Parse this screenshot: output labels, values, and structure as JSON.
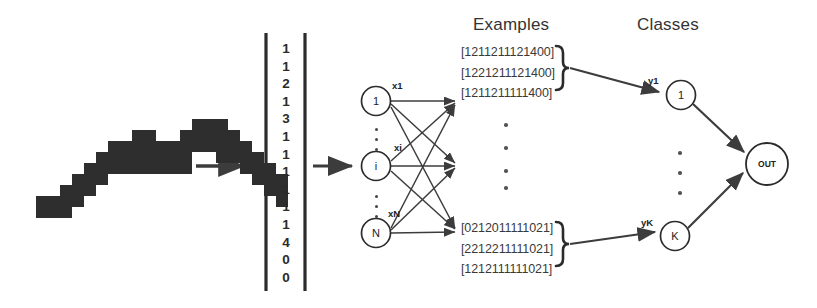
{
  "figure": {
    "headings": {
      "examples": "Examples",
      "classes": "Classes"
    },
    "input_image": {
      "name": "handwritten-stroke-bitmap",
      "description": "pixelated handwritten stroke"
    },
    "feature_vector": {
      "label": "feature-vector",
      "digits": [
        "1",
        "1",
        "2",
        "1",
        "3",
        "1",
        "1",
        "1",
        "1",
        "1",
        "1",
        "4",
        "0",
        "0"
      ]
    },
    "input_layer": {
      "nodes": [
        {
          "label": "1",
          "edge_label": "x1"
        },
        {
          "label": "i",
          "edge_label": "xi"
        },
        {
          "label": "N",
          "edge_label": "xN"
        }
      ],
      "ellipsis": "vertical-dots"
    },
    "examples": {
      "top_group": [
        "[1211211121400]",
        "[1221211121400]",
        "[1211211111400]"
      ],
      "bottom_group": [
        "[0212011111021]",
        "[2212211111021]",
        "[1212111111021]"
      ],
      "middle_ellipsis": "vertical-dots"
    },
    "classes": {
      "nodes": [
        {
          "label": "1",
          "edge_label": "y1"
        },
        {
          "label": "K",
          "edge_label": "yK"
        }
      ],
      "ellipsis": "vertical-dots"
    },
    "output": {
      "label": "OUT"
    },
    "colors": {
      "ink": "#2b2b2b",
      "line": "#3c3c3c",
      "background": "#ffffff",
      "bitmap": "#2e2e2e"
    }
  }
}
